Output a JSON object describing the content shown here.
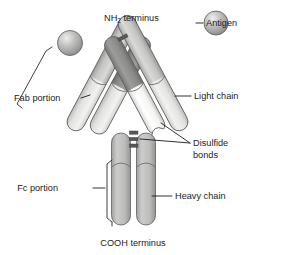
{
  "figure": {
    "background_color": "#ffffff",
    "width": 281,
    "height": 255
  },
  "labels": {
    "nh2_terminus": "NH",
    "nh2_subscript": "2",
    "nh2_terminus_tail": " terminus",
    "antigen": "Antigen",
    "light_chain": "Light chain",
    "disulfide_line1": "Disulfide",
    "disulfide_line2": "bonds",
    "heavy_chain": "Heavy chain",
    "fab_portion": "Fab portion",
    "fc_portion": "Fc portion",
    "cooh_terminus": "COOH terminus"
  },
  "colors": {
    "light_chain_pale": "#e8e8e6",
    "light_chain_white": "#fafafa",
    "heavy_chain_mid": "#c8c8c6",
    "constant_domain_dark": "#8e8e8c",
    "stem_gray": "#b5b5b3",
    "antigen_sphere": "#b0b0ae",
    "outline": "#58585a",
    "text": "#1c1c1c",
    "disulfide": "#58585a"
  },
  "structure": {
    "chain_parts": [
      {
        "name": "left-light-chain",
        "region": "Fab",
        "shade": "pale"
      },
      {
        "name": "left-light-chain-constant",
        "region": "Fab",
        "shade": "dark"
      },
      {
        "name": "left-heavy-chain-variable",
        "region": "Fab",
        "shade": "mid"
      },
      {
        "name": "left-heavy-chain-ch1",
        "region": "Fab",
        "shade": "mid"
      },
      {
        "name": "right-heavy-chain-variable",
        "region": "Fab",
        "shade": "mid"
      },
      {
        "name": "right-light-chain",
        "region": "Fab",
        "shade": "white"
      },
      {
        "name": "right-light-chain-constant",
        "region": "Fab",
        "shade": "dark"
      },
      {
        "name": "left-heavy-chain-stem",
        "region": "Fc",
        "shade": "stem"
      },
      {
        "name": "right-heavy-chain-stem",
        "region": "Fc",
        "shade": "stem"
      }
    ],
    "disulfide_bond_count": 3,
    "antigen_count": 2,
    "antigen_positions": [
      "left-arm-tip",
      "right-arm-tip-unbound"
    ]
  }
}
